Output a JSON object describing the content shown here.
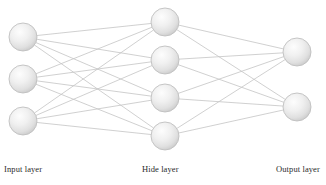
{
  "figure": {
    "kind": "neural-network-diagram",
    "background_color": "#ffffff",
    "node_fill_light": "#fbfbfb",
    "node_fill_mid": "#e2e2e2",
    "node_fill_dark": "#c9c9c9",
    "node_stroke_color": "#c0c0c0",
    "edge_color": "#c4c4c4",
    "label_color": "#2b2b2b"
  },
  "labels": {
    "input": "Input layer",
    "hidden": "Hide layer",
    "output": "Output layer"
  },
  "network": {
    "node_radius": 14,
    "layers": [
      {
        "id": "input",
        "label": "Input layer",
        "count": 3,
        "nodes": [
          {
            "cx": 23,
            "cy": 37
          },
          {
            "cx": 23,
            "cy": 79
          },
          {
            "cx": 23,
            "cy": 121
          }
        ]
      },
      {
        "id": "hidden",
        "label": "Hide layer",
        "count": 4,
        "nodes": [
          {
            "cx": 165,
            "cy": 22
          },
          {
            "cx": 165,
            "cy": 60
          },
          {
            "cx": 165,
            "cy": 98
          },
          {
            "cx": 165,
            "cy": 136
          }
        ]
      },
      {
        "id": "output",
        "label": "Output layer",
        "count": 2,
        "nodes": [
          {
            "cx": 297,
            "cy": 52
          },
          {
            "cx": 297,
            "cy": 107
          }
        ]
      }
    ],
    "connections": [
      {
        "from_layer": "input",
        "to_layer": "hidden",
        "fully_connected": true,
        "edge_count": 12
      },
      {
        "from_layer": "hidden",
        "to_layer": "output",
        "fully_connected": true,
        "edge_count": 8
      }
    ]
  }
}
